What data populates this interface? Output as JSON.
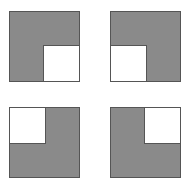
{
  "figure": {
    "name": "four-notched-squares",
    "background_color": "#ffffff",
    "width": 188,
    "height": 188,
    "fill_color": "#8a8a8a",
    "notch_color": "#ffffff",
    "stroke_color": "#555555",
    "stroke_width": 1,
    "square_size": 70,
    "notch_size": 36,
    "shapes": [
      {
        "id": "square-top-left",
        "label": "Square with bottom-right notch",
        "notch_corner": "bottom-right",
        "x": 9,
        "y": 11,
        "size": 70,
        "notch_size": 36
      },
      {
        "id": "square-top-right",
        "label": "Square with bottom-left notch",
        "notch_corner": "bottom-left",
        "x": 110,
        "y": 11,
        "size": 70,
        "notch_size": 36
      },
      {
        "id": "square-bottom-left",
        "label": "Square with top-left notch",
        "notch_corner": "top-left",
        "x": 9,
        "y": 107,
        "size": 70,
        "notch_size": 36
      },
      {
        "id": "square-bottom-right",
        "label": "Square with top-right notch",
        "notch_corner": "top-right",
        "x": 110,
        "y": 107,
        "size": 70,
        "notch_size": 36
      }
    ]
  }
}
